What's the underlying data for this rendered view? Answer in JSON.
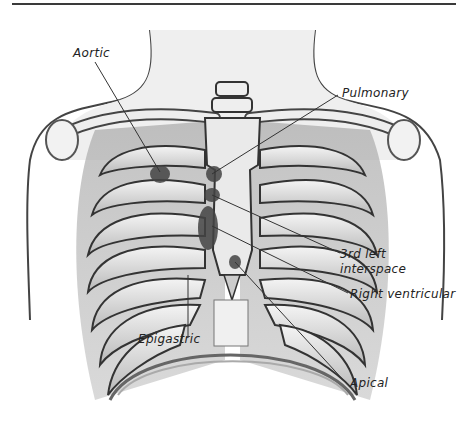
{
  "figure": {
    "labels": {
      "aortic": "Aortic",
      "pulmonary": "Pulmonary",
      "third_left_line1": "3rd left",
      "third_left_line2": "interspace",
      "right_ventricular": "Right ventricular",
      "apical": "Apical",
      "epigastric": "Epigastric"
    }
  }
}
